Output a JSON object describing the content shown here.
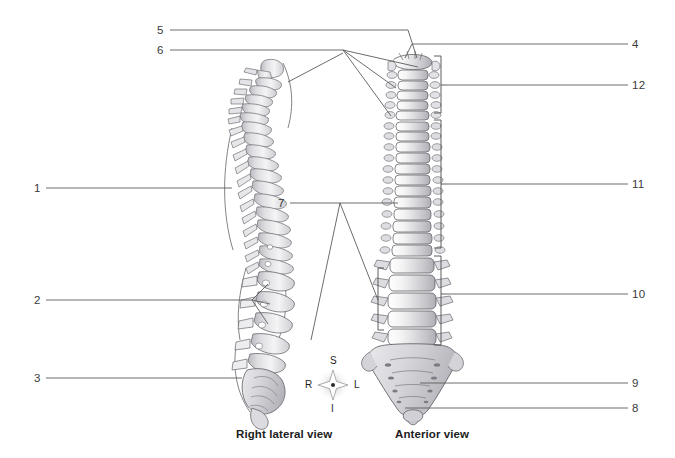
{
  "figure": {
    "title_visible": false,
    "background_color": "#ffffff",
    "line_color": "#5b5b5b",
    "text_color": "#3a3a3a"
  },
  "callouts": {
    "left": [
      {
        "id": "label-5",
        "text": "5",
        "x": 157,
        "y": 24,
        "line": {
          "x1": 170,
          "y1": 30,
          "x2": 408,
          "y2": 30
        }
      },
      {
        "id": "label-6",
        "text": "6",
        "x": 157,
        "y": 44,
        "line": {
          "x1": 170,
          "y1": 50,
          "x2": 343,
          "y2": 50
        }
      },
      {
        "id": "label-1",
        "text": "1",
        "x": 34,
        "y": 182,
        "line": {
          "x1": 46,
          "y1": 188,
          "x2": 232,
          "y2": 188
        }
      },
      {
        "id": "label-2",
        "text": "2",
        "x": 34,
        "y": 294,
        "line": {
          "x1": 46,
          "y1": 300,
          "x2": 252,
          "y2": 300
        }
      },
      {
        "id": "label-3",
        "text": "3",
        "x": 34,
        "y": 372,
        "line": {
          "x1": 46,
          "y1": 378,
          "x2": 242,
          "y2": 378
        }
      }
    ],
    "middle": [
      {
        "id": "label-7",
        "text": "7",
        "x": 278,
        "y": 197,
        "line": {
          "x1": 290,
          "y1": 203,
          "x2": 398,
          "y2": 203
        }
      }
    ],
    "right": [
      {
        "id": "label-4",
        "text": "4",
        "x": 632,
        "y": 38,
        "line": {
          "x1": 628,
          "y1": 44,
          "x2": 412,
          "y2": 44
        }
      },
      {
        "id": "label-12",
        "text": "12",
        "x": 632,
        "y": 79,
        "line": {
          "x1": 628,
          "y1": 85,
          "x2": 447,
          "y2": 85
        }
      },
      {
        "id": "label-11",
        "text": "11",
        "x": 632,
        "y": 178,
        "line": {
          "x1": 628,
          "y1": 184,
          "x2": 447,
          "y2": 184
        }
      },
      {
        "id": "label-10",
        "text": "10",
        "x": 632,
        "y": 288,
        "line": {
          "x1": 628,
          "y1": 294,
          "x2": 447,
          "y2": 294
        }
      },
      {
        "id": "label-9",
        "text": "9",
        "x": 632,
        "y": 377,
        "line": {
          "x1": 628,
          "y1": 383,
          "x2": 420,
          "y2": 383
        }
      },
      {
        "id": "label-8",
        "text": "8",
        "x": 632,
        "y": 402,
        "line": {
          "x1": 628,
          "y1": 408,
          "x2": 405,
          "y2": 408
        }
      }
    ]
  },
  "compass": {
    "superior": "S",
    "inferior": "I",
    "right": "R",
    "left": "L",
    "center_x": 333,
    "center_y": 385
  },
  "views": {
    "lateral": {
      "label": "Right lateral view",
      "x": 236,
      "y": 428
    },
    "anterior": {
      "label": "Anterior view",
      "x": 395,
      "y": 428
    }
  },
  "brackets": {
    "cervical": {
      "x": 441,
      "y_top": 56,
      "y_bottom": 113,
      "tick_y": 85
    },
    "thoracic": {
      "x": 441,
      "y_top": 120,
      "y_bottom": 248,
      "tick_y": 184
    },
    "lumbar_right": {
      "x": 441,
      "y_top": 256,
      "y_bottom": 345,
      "tick_y": 294
    },
    "lumbar_left": {
      "x": 378,
      "y_top": 268,
      "y_bottom": 330,
      "tick_y": 299
    }
  }
}
